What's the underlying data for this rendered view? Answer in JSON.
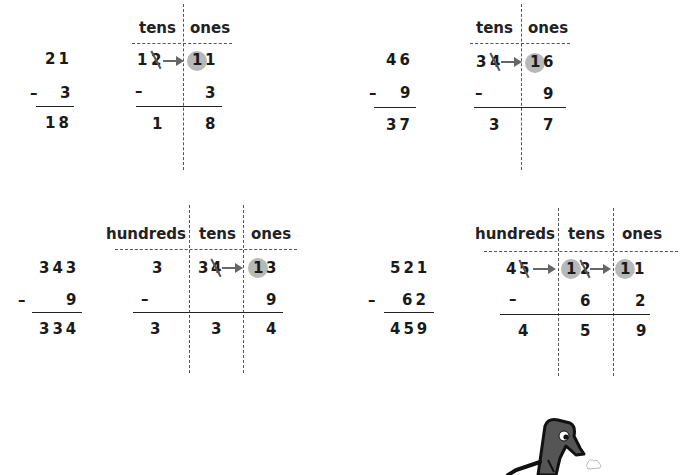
{
  "problems": [
    {
      "id": "p1",
      "standard": {
        "top": "21",
        "minus_sign": "–",
        "subtrahend": "3",
        "result": "18"
      },
      "place_value": {
        "headers": [
          "tens",
          "ones"
        ],
        "regroup_row": {
          "tens_original": "2",
          "tens_new": "1",
          "ones_carry": "1",
          "ones_original": "1"
        },
        "subtract_row": {
          "minus_sign": "–",
          "tens": "",
          "ones": "3"
        },
        "result_row": {
          "tens": "1",
          "ones": "8"
        }
      }
    },
    {
      "id": "p2",
      "standard": {
        "top": "46",
        "minus_sign": "–",
        "subtrahend": "9",
        "result": "37"
      },
      "place_value": {
        "headers": [
          "tens",
          "ones"
        ],
        "regroup_row": {
          "tens_original": "4",
          "tens_new": "3",
          "ones_carry": "1",
          "ones_original": "6"
        },
        "subtract_row": {
          "minus_sign": "–",
          "tens": "",
          "ones": "9"
        },
        "result_row": {
          "tens": "3",
          "ones": "7"
        }
      }
    },
    {
      "id": "p3",
      "standard": {
        "top": "343",
        "minus_sign": "–",
        "subtrahend": "9",
        "result": "334"
      },
      "place_value": {
        "headers": [
          "hundreds",
          "tens",
          "ones"
        ],
        "regroup_row": {
          "hundreds": "3",
          "tens_original": "4",
          "tens_new": "3",
          "ones_carry": "1",
          "ones_original": "3"
        },
        "subtract_row": {
          "minus_sign": "–",
          "tens": "",
          "ones": "9"
        },
        "result_row": {
          "hundreds": "3",
          "tens": "3",
          "ones": "4"
        }
      }
    },
    {
      "id": "p4",
      "standard": {
        "top": "521",
        "minus_sign": "–",
        "subtrahend": "62",
        "result": "459"
      },
      "place_value": {
        "headers": [
          "hundreds",
          "tens",
          "ones"
        ],
        "regroup_row": {
          "hundreds_original": "5",
          "hundreds_new": "4",
          "tens_carry": "1",
          "tens_original": "2",
          "ones_carry": "1",
          "ones_original": "1"
        },
        "subtract_row": {
          "minus_sign": "–",
          "tens": "6",
          "ones": "2"
        },
        "result_row": {
          "hundreds": "4",
          "tens": "5",
          "ones": "9"
        }
      }
    }
  ],
  "mascot": {
    "icon": "cartoon-character-icon"
  },
  "colors": {
    "circle_fill": "#b8b8b8",
    "arrow": "#666666",
    "text": "#1a1a1a"
  }
}
